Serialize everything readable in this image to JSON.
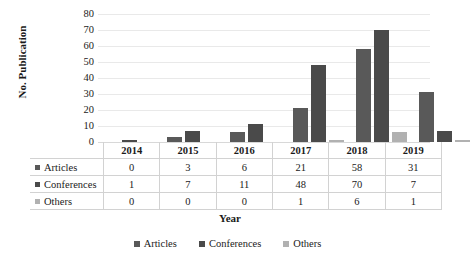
{
  "chart_data": {
    "type": "bar",
    "title": "",
    "xlabel": "Year",
    "ylabel": "No. Publication",
    "categories": [
      "2014",
      "2015",
      "2016",
      "2017",
      "2018",
      "2019"
    ],
    "series": [
      {
        "name": "Articles",
        "values": [
          0,
          3,
          6,
          21,
          58,
          31
        ],
        "color": "#595959"
      },
      {
        "name": "Conferences",
        "values": [
          1,
          7,
          11,
          48,
          70,
          7
        ],
        "color": "#4a4a4a"
      },
      {
        "name": "Others",
        "values": [
          0,
          0,
          0,
          1,
          6,
          1
        ],
        "color": "#b1b1b1"
      }
    ],
    "ylim": [
      0,
      80
    ],
    "yticks": [
      0,
      10,
      20,
      30,
      40,
      50,
      60,
      70,
      80
    ],
    "ytick_labels": [
      "0",
      "10",
      "20",
      "30",
      "40",
      "50",
      "60",
      "70",
      "80"
    ],
    "grid": true,
    "legend_position": "bottom",
    "data_table_visible": true
  },
  "legend": {
    "items": [
      {
        "label": "Articles",
        "color": "#595959"
      },
      {
        "label": "Conferences",
        "color": "#4a4a4a"
      },
      {
        "label": "Others",
        "color": "#b1b1b1"
      }
    ]
  }
}
